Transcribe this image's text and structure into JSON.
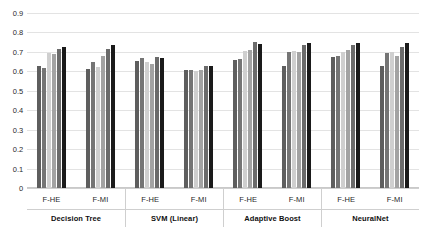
{
  "chart_data": {
    "type": "bar",
    "title": "",
    "subtitle": "",
    "xlabel": "",
    "ylabel": "",
    "ylim": [
      0,
      0.9
    ],
    "grid": true,
    "legend_position": "none",
    "orientation": "vertical",
    "y_ticks": [
      "0.9",
      "0.8",
      "0.7",
      "0.6",
      "0.5",
      "0.4",
      "0.3",
      "0.2",
      "0.1",
      "0"
    ],
    "y_tick_values": [
      0.9,
      0.8,
      0.7,
      0.6,
      0.5,
      0.4,
      0.3,
      0.2,
      0.1,
      0
    ],
    "classifiers": [
      "Decision Tree",
      "SVM (Linear)",
      "Adaptive Boost",
      "NeuralNet"
    ],
    "feature_sets": [
      "F-HE",
      "F-MI"
    ],
    "series": [
      {
        "name": "series-1",
        "color": "#5e5e5e"
      },
      {
        "name": "series-2",
        "color": "#757575"
      },
      {
        "name": "series-3",
        "color": "#cfcfcf"
      },
      {
        "name": "series-4",
        "color": "#a3a3a3"
      },
      {
        "name": "series-5",
        "color": "#6b6b6b"
      },
      {
        "name": "series-6",
        "color": "#1a1a1a"
      }
    ],
    "groups": [
      {
        "classifier": "Decision Tree",
        "subgroups": [
          {
            "feature_set": "F-HE",
            "values": [
              0.625,
              0.615,
              0.695,
              0.69,
              0.715,
              0.725
            ]
          },
          {
            "feature_set": "F-MI",
            "values": [
              0.61,
              0.65,
              0.62,
              0.68,
              0.715,
              0.735
            ]
          }
        ]
      },
      {
        "classifier": "SVM (Linear)",
        "subgroups": [
          {
            "feature_set": "F-HE",
            "values": [
              0.655,
              0.67,
              0.65,
              0.64,
              0.675,
              0.67
            ]
          },
          {
            "feature_set": "F-MI",
            "values": [
              0.605,
              0.605,
              0.6,
              0.605,
              0.625,
              0.625
            ]
          }
        ]
      },
      {
        "classifier": "Adaptive Boost",
        "subgroups": [
          {
            "feature_set": "F-HE",
            "values": [
              0.66,
              0.665,
              0.705,
              0.71,
              0.75,
              0.74
            ]
          },
          {
            "feature_set": "F-MI",
            "values": [
              0.63,
              0.7,
              0.705,
              0.7,
              0.735,
              0.745
            ]
          }
        ]
      },
      {
        "classifier": "NeuralNet",
        "subgroups": [
          {
            "feature_set": "F-HE",
            "values": [
              0.675,
              0.68,
              0.7,
              0.71,
              0.735,
              0.745
            ]
          },
          {
            "feature_set": "F-MI",
            "values": [
              0.625,
              0.695,
              0.7,
              0.68,
              0.725,
              0.745
            ]
          }
        ]
      }
    ],
    "max_value": 0.765
  }
}
